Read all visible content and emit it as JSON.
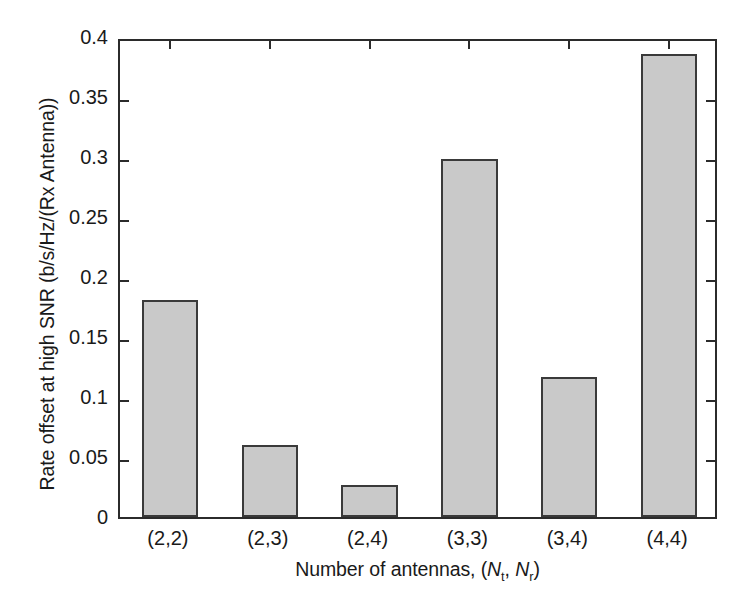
{
  "chart_data": {
    "type": "bar",
    "title": "",
    "xlabel": "Number of antennas, (Nt, Nr)",
    "xlabel_parts": {
      "prefix": "Number of antennas, (",
      "n1": "N",
      "sub1": "t",
      "middle": ", ",
      "n2": "N",
      "sub2": "r",
      "suffix": ")"
    },
    "ylabel": "Rate offset at high SNR (b/s/Hz/(Rx Antenna))",
    "categories": [
      "(2,2)",
      "(2,3)",
      "(2,4)",
      "(3,3)",
      "(3,4)",
      "(4,4)"
    ],
    "values": [
      0.181,
      0.06,
      0.027,
      0.298,
      0.117,
      0.386
    ],
    "ylim": [
      0,
      0.4
    ],
    "yticks": [
      0,
      0.05,
      0.1,
      0.15,
      0.2,
      0.25,
      0.3,
      0.35,
      0.4
    ],
    "ytick_labels": [
      "0",
      "0.05",
      "0.1",
      "0.15",
      "0.2",
      "0.25",
      "0.3",
      "0.35",
      "0.4"
    ],
    "grid": false,
    "legend": null,
    "bar_color": "#c9c9c9",
    "bar_edge_color": "#3a3a3a",
    "axis_color": "#2b2b2b",
    "background_color": "#ffffff"
  }
}
